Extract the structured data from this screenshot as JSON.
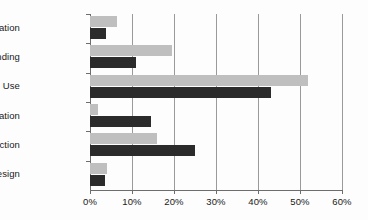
{
  "chart_data": {
    "type": "bar",
    "orientation": "horizontal",
    "title": "",
    "xlabel": "",
    "ylabel": "",
    "categories": [
      "Information",
      "Understanding",
      "Use",
      "Coordination",
      "Selection",
      "Design"
    ],
    "series": [
      {
        "name": "series-light",
        "color": "#bfbfbf",
        "values": [
          6.5,
          19.5,
          52.0,
          2.0,
          16.0,
          4.0
        ]
      },
      {
        "name": "series-dark",
        "color": "#2b2b2b",
        "values": [
          3.8,
          11.0,
          43.0,
          14.5,
          25.0,
          3.5
        ]
      }
    ],
    "xlim": [
      0,
      60
    ],
    "xticks": [
      0,
      10,
      20,
      30,
      40,
      50,
      60
    ],
    "xtick_labels": [
      "0%",
      "10%",
      "20%",
      "30%",
      "40%",
      "50%",
      "60%"
    ],
    "grid": true,
    "grid_axis": "x",
    "legend": "none",
    "background": "#ffffff",
    "axis_color": "#6d6d6d",
    "gridline_color": "#9a9a9a"
  }
}
